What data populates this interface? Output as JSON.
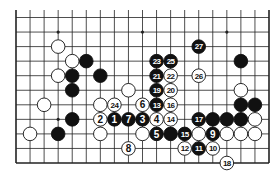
{
  "diagram": {
    "type": "go-board-fragment",
    "board_size": 19,
    "visible_rows": 11,
    "edges": [
      "left",
      "right",
      "bottom"
    ],
    "colors": {
      "line": "#222222",
      "black_stone": "#111111",
      "white_stone": "#ffffff",
      "background": "#ffffff"
    },
    "star_points": [
      {
        "col": 3,
        "row": 1
      },
      {
        "col": 9,
        "row": 1
      },
      {
        "col": 15,
        "row": 1
      },
      {
        "col": 3,
        "row": 7
      },
      {
        "col": 9,
        "row": 7
      },
      {
        "col": 15,
        "row": 7
      }
    ],
    "stones": [
      {
        "col": 3,
        "row": 2,
        "color": "white",
        "label": ""
      },
      {
        "col": 4,
        "row": 3,
        "color": "white",
        "label": ""
      },
      {
        "col": 5,
        "row": 3,
        "color": "black",
        "label": ""
      },
      {
        "col": 3,
        "row": 4,
        "color": "white",
        "label": ""
      },
      {
        "col": 4,
        "row": 4,
        "color": "black",
        "label": ""
      },
      {
        "col": 6,
        "row": 4,
        "color": "black",
        "label": ""
      },
      {
        "col": 4,
        "row": 5,
        "color": "black",
        "label": ""
      },
      {
        "col": 8,
        "row": 5,
        "color": "white",
        "label": ""
      },
      {
        "col": 2,
        "row": 6,
        "color": "white",
        "label": ""
      },
      {
        "col": 6,
        "row": 6,
        "color": "white",
        "label": ""
      },
      {
        "col": 4,
        "row": 7,
        "color": "black",
        "label": ""
      },
      {
        "col": 1,
        "row": 8,
        "color": "white",
        "label": ""
      },
      {
        "col": 3,
        "row": 8,
        "color": "black",
        "label": ""
      },
      {
        "col": 6,
        "row": 8,
        "color": "white",
        "label": ""
      },
      {
        "col": 9,
        "row": 8,
        "color": "white",
        "label": ""
      },
      {
        "col": 11,
        "row": 8,
        "color": "black",
        "label": ""
      },
      {
        "col": 13,
        "row": 8,
        "color": "white",
        "label": ""
      },
      {
        "col": 15,
        "row": 8,
        "color": "white",
        "label": ""
      },
      {
        "col": 16,
        "row": 8,
        "color": "white",
        "label": ""
      },
      {
        "col": 17,
        "row": 8,
        "color": "white",
        "label": ""
      },
      {
        "col": 14,
        "row": 7,
        "color": "black",
        "label": ""
      },
      {
        "col": 15,
        "row": 7,
        "color": "black",
        "label": ""
      },
      {
        "col": 16,
        "row": 7,
        "color": "black",
        "label": ""
      },
      {
        "col": 17,
        "row": 7,
        "color": "white",
        "label": ""
      },
      {
        "col": 16,
        "row": 6,
        "color": "black",
        "label": ""
      },
      {
        "col": 17,
        "row": 6,
        "color": "black",
        "label": ""
      },
      {
        "col": 16,
        "row": 5,
        "color": "white",
        "label": ""
      },
      {
        "col": 16,
        "row": 3,
        "color": "black",
        "label": ""
      },
      {
        "col": 7,
        "row": 7,
        "color": "black",
        "label": "1"
      },
      {
        "col": 6,
        "row": 7,
        "color": "white",
        "label": "2"
      },
      {
        "col": 9,
        "row": 7,
        "color": "black",
        "label": "3"
      },
      {
        "col": 10,
        "row": 7,
        "color": "white",
        "label": "4"
      },
      {
        "col": 10,
        "row": 8,
        "color": "black",
        "label": "5"
      },
      {
        "col": 9,
        "row": 6,
        "color": "white",
        "label": "6"
      },
      {
        "col": 8,
        "row": 7,
        "color": "black",
        "label": "7"
      },
      {
        "col": 8,
        "row": 9,
        "color": "white",
        "label": "8"
      },
      {
        "col": 14,
        "row": 8,
        "color": "black",
        "label": "9"
      },
      {
        "col": 14,
        "row": 9,
        "color": "white",
        "label": "10"
      },
      {
        "col": 13,
        "row": 9,
        "color": "black",
        "label": "11"
      },
      {
        "col": 12,
        "row": 9,
        "color": "white",
        "label": "12"
      },
      {
        "col": 10,
        "row": 6,
        "color": "black",
        "label": "13"
      },
      {
        "col": 11,
        "row": 7,
        "color": "white",
        "label": "14"
      },
      {
        "col": 12,
        "row": 8,
        "color": "black",
        "label": "15"
      },
      {
        "col": 11,
        "row": 6,
        "color": "white",
        "label": "16"
      },
      {
        "col": 13,
        "row": 7,
        "color": "black",
        "label": "17"
      },
      {
        "col": 15,
        "row": 10,
        "color": "white",
        "label": "18"
      },
      {
        "col": 10,
        "row": 5,
        "color": "black",
        "label": "19"
      },
      {
        "col": 11,
        "row": 5,
        "color": "white",
        "label": "20"
      },
      {
        "col": 10,
        "row": 4,
        "color": "black",
        "label": "21"
      },
      {
        "col": 11,
        "row": 4,
        "color": "white",
        "label": "22"
      },
      {
        "col": 10,
        "row": 3,
        "color": "black",
        "label": "23"
      },
      {
        "col": 7,
        "row": 6,
        "color": "white",
        "label": "24"
      },
      {
        "col": 11,
        "row": 3,
        "color": "black",
        "label": "25"
      },
      {
        "col": 13,
        "row": 4,
        "color": "white",
        "label": "26"
      },
      {
        "col": 13,
        "row": 2,
        "color": "black",
        "label": "27"
      }
    ]
  }
}
